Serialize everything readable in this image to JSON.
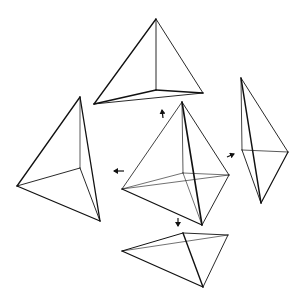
{
  "diagram": {
    "colors": {
      "stroke": "#111111",
      "background": "#ffffff"
    },
    "shapes": [
      {
        "name": "center-tetrahedron",
        "edges": [
          {
            "from": [
              182,
              102
            ],
            "to": [
              122,
              189
            ],
            "w": 0.8
          },
          {
            "from": [
              182,
              102
            ],
            "to": [
              202,
              225
            ],
            "w": 1.6
          },
          {
            "from": [
              182,
              102
            ],
            "to": [
              229,
              175
            ],
            "w": 0.9
          },
          {
            "from": [
              182,
              102
            ],
            "to": [
              183,
              173
            ],
            "w": 0.7
          },
          {
            "from": [
              122,
              189
            ],
            "to": [
              202,
              225
            ],
            "w": 1.3
          },
          {
            "from": [
              202,
              225
            ],
            "to": [
              229,
              175
            ],
            "w": 0.9
          },
          {
            "from": [
              122,
              189
            ],
            "to": [
              229,
              175
            ],
            "w": 0.6
          },
          {
            "from": [
              122,
              189
            ],
            "to": [
              183,
              173
            ],
            "w": 0.6
          },
          {
            "from": [
              183,
              173
            ],
            "to": [
              229,
              175
            ],
            "w": 0.6
          },
          {
            "from": [
              183,
              173
            ],
            "to": [
              202,
              225
            ],
            "w": 0.6
          }
        ]
      },
      {
        "name": "top-tetrahedron",
        "edges": [
          {
            "from": [
              156,
              19
            ],
            "to": [
              94,
              104
            ],
            "w": 1.3
          },
          {
            "from": [
              156,
              19
            ],
            "to": [
              203,
              93
            ],
            "w": 0.9
          },
          {
            "from": [
              156,
              19
            ],
            "to": [
              156,
              90
            ],
            "w": 0.9
          },
          {
            "from": [
              94,
              104
            ],
            "to": [
              156,
              90
            ],
            "w": 1.6
          },
          {
            "from": [
              156,
              90
            ],
            "to": [
              203,
              93
            ],
            "w": 1.3
          },
          {
            "from": [
              94,
              104
            ],
            "to": [
              203,
              93
            ],
            "w": 0.9
          }
        ]
      },
      {
        "name": "left-tetrahedron",
        "edges": [
          {
            "from": [
              80,
              97
            ],
            "to": [
              17,
              186
            ],
            "w": 1.3
          },
          {
            "from": [
              80,
              97
            ],
            "to": [
              100,
              221
            ],
            "w": 1.3
          },
          {
            "from": [
              80,
              97
            ],
            "to": [
              80,
              168
            ],
            "w": 0.7
          },
          {
            "from": [
              17,
              186
            ],
            "to": [
              100,
              221
            ],
            "w": 1.3
          },
          {
            "from": [
              17,
              186
            ],
            "to": [
              80,
              168
            ],
            "w": 0.9
          },
          {
            "from": [
              80,
              168
            ],
            "to": [
              100,
              221
            ],
            "w": 0.9
          }
        ]
      },
      {
        "name": "right-tetrahedron",
        "edges": [
          {
            "from": [
              241,
              78
            ],
            "to": [
              242,
              150
            ],
            "w": 0.8
          },
          {
            "from": [
              241,
              78
            ],
            "to": [
              288,
              152
            ],
            "w": 0.9
          },
          {
            "from": [
              241,
              78
            ],
            "to": [
              261,
              203
            ],
            "w": 1.5
          },
          {
            "from": [
              242,
              150
            ],
            "to": [
              288,
              152
            ],
            "w": 0.7
          },
          {
            "from": [
              242,
              150
            ],
            "to": [
              261,
              203
            ],
            "w": 0.9
          },
          {
            "from": [
              288,
              152
            ],
            "to": [
              261,
              203
            ],
            "w": 1.2
          }
        ]
      },
      {
        "name": "bottom-tetrahedron",
        "edges": [
          {
            "from": [
              122,
              251
            ],
            "to": [
              183,
              233
            ],
            "w": 1.0
          },
          {
            "from": [
              122,
              251
            ],
            "to": [
              228,
              235
            ],
            "w": 0.6
          },
          {
            "from": [
              122,
              251
            ],
            "to": [
              203,
              287
            ],
            "w": 1.3
          },
          {
            "from": [
              183,
              233
            ],
            "to": [
              228,
              235
            ],
            "w": 0.9
          },
          {
            "from": [
              183,
              233
            ],
            "to": [
              203,
              287
            ],
            "w": 1.4
          },
          {
            "from": [
              228,
              235
            ],
            "to": [
              203,
              287
            ],
            "w": 0.9
          }
        ]
      }
    ],
    "arrows": [
      {
        "name": "arrow-up",
        "from": [
          163,
          118
        ],
        "to": [
          162,
          110
        ]
      },
      {
        "name": "arrow-left",
        "from": [
          124,
          171
        ],
        "to": [
          114,
          171
        ]
      },
      {
        "name": "arrow-up-right",
        "from": [
          227,
          157
        ],
        "to": [
          234,
          154
        ]
      },
      {
        "name": "arrow-down",
        "from": [
          178,
          218
        ],
        "to": [
          178,
          226
        ]
      }
    ]
  }
}
